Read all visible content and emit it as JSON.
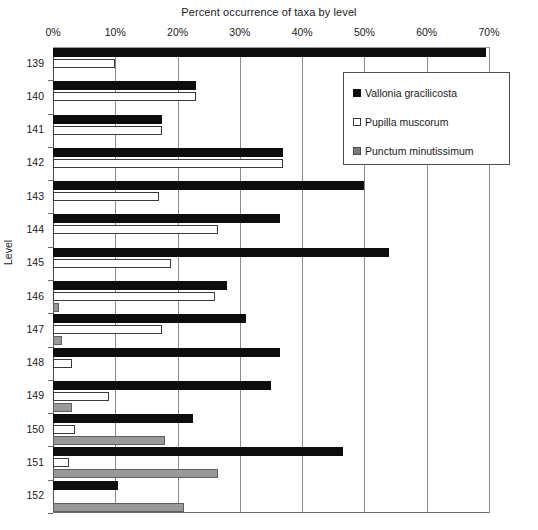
{
  "chart_data": {
    "type": "bar",
    "title": "Percent occurrence of taxa by level",
    "xlabel": "",
    "ylabel": "Level",
    "orientation": "horizontal",
    "xlim": [
      0,
      70
    ],
    "xticks": [
      0,
      10,
      20,
      30,
      40,
      50,
      60,
      70
    ],
    "xtick_labels": [
      "0%",
      "10%",
      "20%",
      "30%",
      "40%",
      "50%",
      "60%",
      "70%"
    ],
    "grid": true,
    "legend_position": "top-right",
    "categories": [
      "139",
      "140",
      "141",
      "142",
      "143",
      "144",
      "145",
      "146",
      "147",
      "148",
      "149",
      "150",
      "151",
      "152"
    ],
    "series": [
      {
        "name": "Vallonia gracilicosta",
        "color": "#0d0d0d",
        "swatch": "filled-black",
        "values": [
          69.5,
          23.0,
          17.5,
          37.0,
          50.0,
          36.5,
          54.0,
          28.0,
          31.0,
          36.5,
          35.0,
          22.5,
          46.5,
          10.5
        ]
      },
      {
        "name": "Pupilla muscorum",
        "color": "#ffffff",
        "swatch": "open-white",
        "values": [
          10.0,
          23.0,
          17.5,
          37.0,
          17.0,
          26.5,
          19.0,
          26.0,
          17.5,
          3.0,
          9.0,
          3.5,
          2.5,
          0.0
        ]
      },
      {
        "name": "Punctum minutissimum",
        "color": "#999999",
        "swatch": "filled-gray",
        "values": [
          0.0,
          0.0,
          0.0,
          0.0,
          0.0,
          0.0,
          0.0,
          1.0,
          1.5,
          0.0,
          3.0,
          18.0,
          26.5,
          21.0
        ]
      }
    ]
  }
}
